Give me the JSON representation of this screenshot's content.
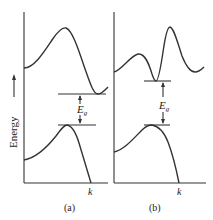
{
  "figure": {
    "y_axis_label": "Energy",
    "x_axis_label": "k",
    "gap_label": "E",
    "gap_subscript": "g",
    "line_color": "#333333",
    "panels": [
      {
        "id": "a",
        "caption": "(a)",
        "description": "indirect band gap: conduction band minimum offset from valence band maximum"
      },
      {
        "id": "b",
        "caption": "(b)",
        "description": "direct band gap: conduction band minimum aligned with valence band maximum"
      }
    ]
  }
}
